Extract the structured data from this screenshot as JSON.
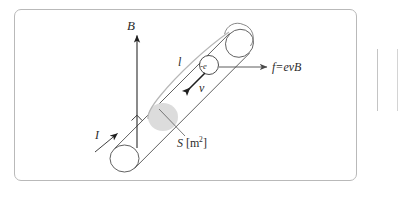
{
  "figure": {
    "frame": {
      "border_color": "#b9b9b9",
      "background": "#ffffff"
    },
    "conductor": {
      "name": "cylindrical-conductor",
      "outline_color": "#555555",
      "fill": "#ffffff",
      "cross_section_fill": "#dcdcdc"
    },
    "labels": {
      "magnetic_field": "B",
      "current": "I",
      "length": "l",
      "charge": "-e",
      "velocity": "v",
      "force": "f=evB",
      "area_symbol": "S",
      "area_unit_open": "[m",
      "area_unit_exp": "2",
      "area_unit_close": "]"
    },
    "arrows": {
      "magnetic_field_direction": "up",
      "current_direction": "up-right",
      "velocity_direction": "down-left",
      "force_direction": "right"
    },
    "markers": {
      "right_angle": "right-angle-mark"
    }
  }
}
